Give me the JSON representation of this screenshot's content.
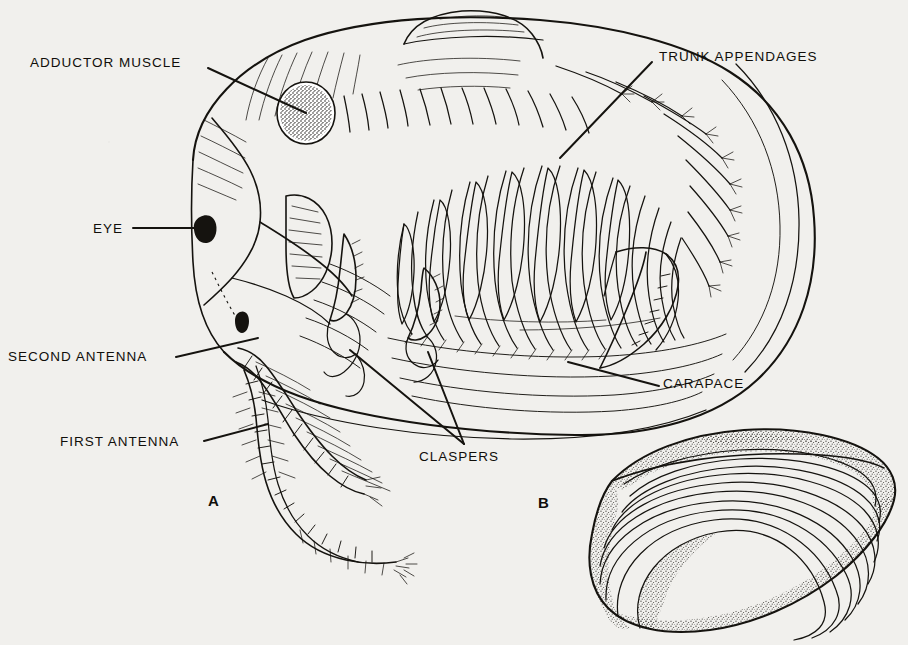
{
  "figure": {
    "kind": "scientific-line-drawing",
    "background_color": "#f1f0ed",
    "ink_color": "#15130f",
    "panels": [
      {
        "id": "A",
        "label": "A",
        "caption": "lateral view with left valve removed showing internal anatomy"
      },
      {
        "id": "B",
        "label": "B",
        "caption": "external view of bivalved carapace showing concentric growth lines"
      }
    ]
  },
  "labels": [
    {
      "id": "adductor-muscle",
      "text": "ADDUCTOR MUSCLE",
      "x": 30,
      "y": 62,
      "anchor": "left"
    },
    {
      "id": "eye",
      "text": "EYE",
      "x": 93,
      "y": 228,
      "anchor": "left"
    },
    {
      "id": "second-antenna",
      "text": "SECOND ANTENNA",
      "x": 8,
      "y": 356,
      "anchor": "left"
    },
    {
      "id": "first-antenna",
      "text": "FIRST ANTENNA",
      "x": 60,
      "y": 441,
      "anchor": "left"
    },
    {
      "id": "trunk-appendages",
      "text": "TRUNK APPENDAGES",
      "x": 659,
      "y": 56,
      "anchor": "left"
    },
    {
      "id": "carapace",
      "text": "CARAPACE",
      "x": 663,
      "y": 383,
      "anchor": "left"
    },
    {
      "id": "claspers",
      "text": "CLASPERS",
      "x": 419,
      "y": 450,
      "anchor": "left"
    }
  ],
  "panel_labels": [
    {
      "id": "panel-a",
      "text": "A",
      "x": 208,
      "y": 500
    },
    {
      "id": "panel-b",
      "text": "B",
      "x": 538,
      "y": 502
    }
  ],
  "shell_panel": {
    "growth_ring_count": 10,
    "shading": "stippled"
  },
  "trunk_appendage_count": 22,
  "antenna_segments": {
    "first_antenna": 12,
    "second_antenna": 14
  }
}
